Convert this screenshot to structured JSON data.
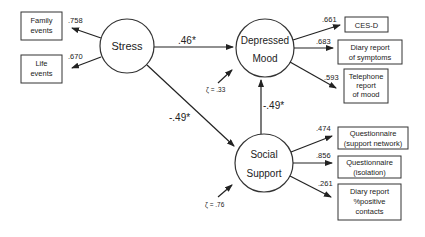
{
  "latent": {
    "stress": {
      "label": "Stress"
    },
    "depressed": {
      "line1": "Depressed",
      "line2": "Mood",
      "zeta": "ζ = .33"
    },
    "social": {
      "line1": "Social",
      "line2": "Support",
      "zeta": "ζ = .76"
    }
  },
  "paths": {
    "stress_to_depressed": ".46*",
    "stress_to_social": "-.49*",
    "social_to_depressed": "-.49*"
  },
  "stress_indicators": [
    {
      "line1": "Family",
      "line2": "events",
      "loading": ".758"
    },
    {
      "line1": "Life",
      "line2": "events",
      "loading": ".670"
    }
  ],
  "depressed_indicators": [
    {
      "line1": "CES-D",
      "loading": ".661"
    },
    {
      "line1": "Diary report",
      "line2": "of symptoms",
      "loading": ".683"
    },
    {
      "line1": "Telephone",
      "line2": "report",
      "line3": "of mood",
      "loading": ".593"
    }
  ],
  "social_indicators": [
    {
      "line1": "Questionnaire",
      "line2": "(support network)",
      "loading": ".474"
    },
    {
      "line1": "Questionnaire",
      "line2": "(isolation)",
      "loading": ".856"
    },
    {
      "line1": "Diary report",
      "line2": "%positive",
      "line3": "contacts",
      "loading": ".261"
    }
  ]
}
